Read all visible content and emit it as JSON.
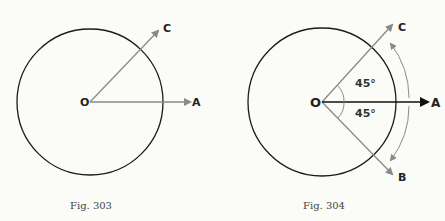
{
  "figures": [
    {
      "caption": "Fig. 303",
      "labels": {
        "origin": "O",
        "a": "A",
        "c": "C"
      }
    },
    {
      "caption": "Fig. 304",
      "labels": {
        "origin": "O",
        "a": "A",
        "b": "B",
        "c": "C"
      },
      "angles": [
        "45°",
        "45°"
      ]
    }
  ],
  "colors": {
    "circle": "#1a1a1a",
    "gray_arrow": "#8a8a8a",
    "black_arrow": "#111111"
  }
}
